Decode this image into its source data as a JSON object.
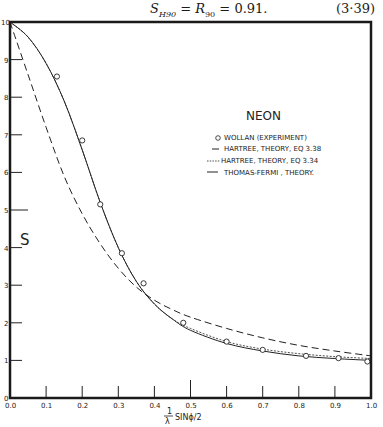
{
  "equation": {
    "lhs": "S",
    "lhs_sub": "H90",
    "mid": "R",
    "mid_sub": "90",
    "value": "0.91.",
    "number": "(3·39)"
  },
  "chart_data": {
    "type": "line",
    "title": "NEON",
    "xlabel": "1/λ SINϕ/2",
    "xlabel_num": "1",
    "xlabel_den": "λ",
    "xlabel_rest": "SINϕ/2",
    "ylabel": "S",
    "xlim": [
      0.0,
      1.0
    ],
    "ylim": [
      0,
      10
    ],
    "grid": false,
    "legend_position": "upper right",
    "x_ticks": [
      "0.0",
      "0.1",
      "0.2",
      "0.3",
      "0.4",
      "0.5",
      "0.6",
      "0.7",
      "0.8",
      "0.9",
      "1.0"
    ],
    "y_ticks": [
      "0",
      "1",
      "2",
      "3",
      "4",
      "5",
      "6",
      "7",
      "8",
      "9",
      "10"
    ],
    "legend": [
      {
        "marker": "o",
        "label": "WOLLAN (EXPERIMENT)"
      },
      {
        "marker": "—",
        "label": "HARTREE, THEORY, EQ 3.38"
      },
      {
        "marker": "----",
        "label": "HARTREE, THEORY, EQ 3.34"
      },
      {
        "marker": "——",
        "label": "THOMAS-FERMI , THEORY."
      }
    ],
    "series": [
      {
        "name": "WOLLAN (EXPERIMENT)",
        "style": "circles",
        "x": [
          0.13,
          0.2,
          0.25,
          0.31,
          0.37,
          0.48,
          0.6,
          0.7,
          0.82,
          0.91,
          0.99
        ],
        "y": [
          8.55,
          6.85,
          5.15,
          3.85,
          3.05,
          2.0,
          1.5,
          1.28,
          1.12,
          1.06,
          0.97
        ]
      },
      {
        "name": "HARTREE, THEORY, EQ 3.38",
        "style": "solid",
        "x": [
          0.0,
          0.05,
          0.1,
          0.15,
          0.2,
          0.25,
          0.3,
          0.35,
          0.4,
          0.45,
          0.5,
          0.6,
          0.7,
          0.8,
          0.9,
          1.0
        ],
        "y": [
          10.0,
          9.6,
          8.9,
          7.9,
          6.6,
          5.2,
          4.0,
          3.1,
          2.5,
          2.1,
          1.8,
          1.45,
          1.25,
          1.12,
          1.05,
          1.0
        ]
      },
      {
        "name": "HARTREE, THEORY, EQ 3.34",
        "style": "short-dashed",
        "x": [
          0.0,
          0.05,
          0.1,
          0.15,
          0.2,
          0.25,
          0.3,
          0.35,
          0.4,
          0.45,
          0.5,
          0.6,
          0.7,
          0.8,
          0.9,
          1.0
        ],
        "y": [
          10.0,
          9.6,
          8.9,
          7.9,
          6.6,
          5.2,
          4.0,
          3.1,
          2.5,
          2.1,
          1.85,
          1.5,
          1.3,
          1.18,
          1.1,
          1.05
        ]
      },
      {
        "name": "THOMAS-FERMI , THEORY.",
        "style": "long-dashed",
        "x": [
          0.0,
          0.05,
          0.1,
          0.15,
          0.2,
          0.25,
          0.3,
          0.35,
          0.4,
          0.45,
          0.5,
          0.6,
          0.7,
          0.8,
          0.9,
          1.0
        ],
        "y": [
          10.0,
          8.6,
          7.2,
          5.9,
          4.9,
          4.1,
          3.45,
          2.95,
          2.6,
          2.35,
          2.15,
          1.85,
          1.6,
          1.4,
          1.25,
          1.12
        ]
      }
    ]
  }
}
